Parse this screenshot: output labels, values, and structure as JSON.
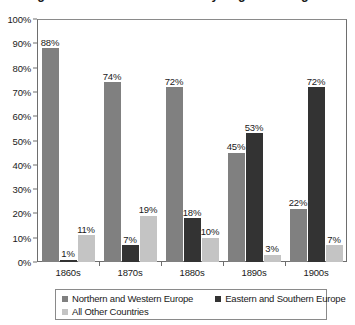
{
  "title": {
    "text": "Immigration to the United States by Region of Origin"
  },
  "chart_data": {
    "type": "bar",
    "title": "Immigration to the United States by Region of Origin",
    "xlabel": "",
    "ylabel": "",
    "ylim": [
      0,
      100
    ],
    "ytick_labels": [
      "100%",
      "90%",
      "80%",
      "70%",
      "60%",
      "50%",
      "40%",
      "30%",
      "20%",
      "10%",
      "0%"
    ],
    "ytick_values": [
      100,
      90,
      80,
      70,
      60,
      50,
      40,
      30,
      20,
      10,
      0
    ],
    "grid": false,
    "legend_position": "bottom",
    "categories": [
      "1860s",
      "1870s",
      "1880s",
      "1890s",
      "1900s"
    ],
    "series": [
      {
        "name": "Northern and Western Europe",
        "color": "#808080",
        "values": [
          88,
          74,
          72,
          45,
          22
        ],
        "labels": [
          "88%",
          "74%",
          "72%",
          "45%",
          "22%"
        ]
      },
      {
        "name": "Eastern and Southern Europe",
        "color": "#333333",
        "values": [
          1,
          7,
          18,
          53,
          72
        ],
        "labels": [
          "1%",
          "7%",
          "18%",
          "53%",
          "72%"
        ]
      },
      {
        "name": "All Other Countries",
        "color": "#c4c4c4",
        "values": [
          11,
          19,
          10,
          3,
          7
        ],
        "labels": [
          "11%",
          "19%",
          "10%",
          "3%",
          "7%"
        ]
      }
    ]
  },
  "colors": {
    "series_1": "#808080",
    "series_2": "#333333",
    "series_3": "#c4c4c4",
    "axis": "#6e6e6e",
    "text": "#1a1a1a",
    "background": "#ffffff"
  }
}
